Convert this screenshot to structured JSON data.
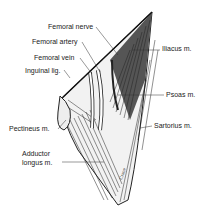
{
  "figure": {
    "labels": [
      {
        "id": "femoral-nerve",
        "text": "Femoral nerve",
        "x": 48,
        "y": 23
      },
      {
        "id": "femoral-artery",
        "text": "Femoral artery",
        "x": 32,
        "y": 38
      },
      {
        "id": "femoral-vein",
        "text": "Femoral vein",
        "x": 34,
        "y": 54
      },
      {
        "id": "inguinal-lig",
        "text": "Inguinal lig.",
        "x": 25,
        "y": 67
      },
      {
        "id": "iliacus",
        "text": "Iliacus m.",
        "x": 162,
        "y": 45
      },
      {
        "id": "psoas",
        "text": "Psoas m.",
        "x": 166,
        "y": 91
      },
      {
        "id": "pectineus",
        "text": "Pectineus m.",
        "x": 9,
        "y": 125
      },
      {
        "id": "sartorius",
        "text": "Sartorius m.",
        "x": 154,
        "y": 122
      },
      {
        "id": "adductor-1",
        "text": "Adductor",
        "x": 22,
        "y": 150
      },
      {
        "id": "adductor-2",
        "text": "longus m.",
        "x": 22,
        "y": 159
      }
    ],
    "signature": "Crane"
  }
}
